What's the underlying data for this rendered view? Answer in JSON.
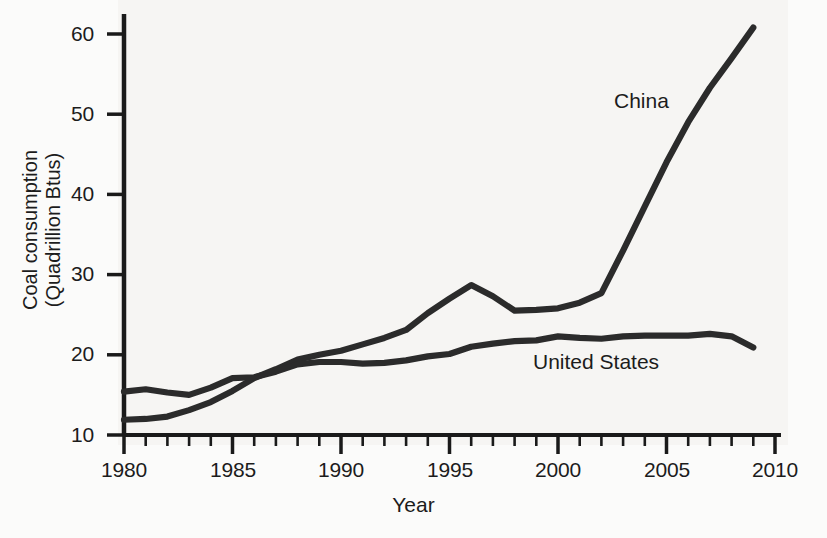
{
  "chart_data": {
    "type": "line",
    "title": "",
    "xlabel": "Year",
    "ylabel": "Coal consumption (Quadrillion Btus)",
    "ylabel_line1": "Coal consumption",
    "ylabel_line2": "(Quadrillion Btus)",
    "xlim": [
      1980,
      2010
    ],
    "ylim": [
      10,
      62
    ],
    "grid": false,
    "legend_position": "inline-annotations",
    "x_ticks": [
      1980,
      1985,
      1990,
      1995,
      2000,
      2005,
      2010
    ],
    "x_tick_labels": [
      "1980",
      "1985",
      "1990",
      "1995",
      "2000",
      "2005",
      "2010"
    ],
    "x_minor_tick_interval": 1,
    "y_ticks": [
      10,
      20,
      30,
      40,
      50,
      60
    ],
    "y_tick_labels": [
      "10",
      "20",
      "30",
      "40",
      "50",
      "60"
    ],
    "x": [
      1980,
      1981,
      1982,
      1983,
      1984,
      1985,
      1986,
      1987,
      1988,
      1989,
      1990,
      1991,
      1992,
      1993,
      1994,
      1995,
      1996,
      1997,
      1998,
      1999,
      2000,
      2001,
      2002,
      2003,
      2004,
      2005,
      2006,
      2007,
      2008,
      2009
    ],
    "series": [
      {
        "name": "China",
        "color": "#2b2b2b",
        "values": [
          11.9,
          12.0,
          12.3,
          13.1,
          14.1,
          15.5,
          17.1,
          18.2,
          19.4,
          20.0,
          20.5,
          21.3,
          22.1,
          23.1,
          25.2,
          27.0,
          28.7,
          27.3,
          25.5,
          25.6,
          25.8,
          26.5,
          27.7,
          33.0,
          38.5,
          44.0,
          49.0,
          53.3,
          57.0,
          60.8
        ]
      },
      {
        "name": "United States",
        "color": "#2b2b2b",
        "values": [
          15.4,
          15.7,
          15.3,
          15.0,
          15.9,
          17.1,
          17.2,
          17.9,
          18.8,
          19.1,
          19.1,
          18.9,
          19.0,
          19.3,
          19.8,
          20.1,
          21.0,
          21.4,
          21.7,
          21.8,
          22.3,
          22.1,
          22.0,
          22.3,
          22.4,
          22.4,
          22.4,
          22.6,
          22.3,
          20.9
        ]
      }
    ],
    "annotations": [
      {
        "text": "China",
        "x": 2004.6,
        "y": 50.0
      },
      {
        "text": "United States",
        "x": 2000.9,
        "y": 18.9
      }
    ]
  }
}
